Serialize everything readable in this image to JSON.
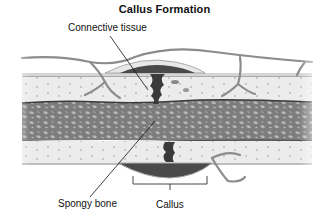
{
  "diagram": {
    "title": "Callus Formation",
    "labels": {
      "connective_tissue": "Connective tissue",
      "spongy_bone": "Spongy bone",
      "callus": "Callus"
    },
    "colors": {
      "background": "#ffffff",
      "compact_bone": "#e6e6e6",
      "spongy_bone": "#7a7a7a",
      "callus_dark": "#3a3a3a",
      "vessel": "#8a8a8a",
      "text": "#111111"
    }
  }
}
